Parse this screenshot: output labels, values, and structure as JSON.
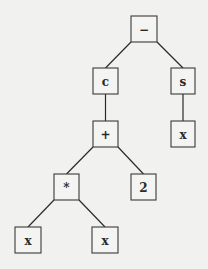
{
  "diagram": {
    "type": "expression-tree",
    "nodes": [
      {
        "id": "n_minus",
        "label": "−",
        "x": 131,
        "y": 16,
        "w": 26,
        "h": 26
      },
      {
        "id": "n_c",
        "label": "c",
        "x": 93,
        "y": 68,
        "w": 25,
        "h": 26
      },
      {
        "id": "n_s",
        "label": "s",
        "x": 171,
        "y": 68,
        "w": 24,
        "h": 26
      },
      {
        "id": "n_plus",
        "label": "+",
        "x": 93,
        "y": 121,
        "w": 25,
        "h": 26
      },
      {
        "id": "n_x_s",
        "label": "x",
        "x": 171,
        "y": 121,
        "w": 24,
        "h": 26
      },
      {
        "id": "n_mul",
        "label": "*",
        "x": 54,
        "y": 174,
        "w": 25,
        "h": 26
      },
      {
        "id": "n_two",
        "label": "2",
        "x": 131,
        "y": 174,
        "w": 25,
        "h": 26
      },
      {
        "id": "n_x_l",
        "label": "x",
        "x": 15,
        "y": 227,
        "w": 26,
        "h": 26
      },
      {
        "id": "n_x_r",
        "label": "x",
        "x": 92,
        "y": 227,
        "w": 26,
        "h": 26
      }
    ],
    "edges": [
      {
        "from": "n_minus",
        "to": "n_c"
      },
      {
        "from": "n_minus",
        "to": "n_s"
      },
      {
        "from": "n_c",
        "to": "n_plus"
      },
      {
        "from": "n_s",
        "to": "n_x_s"
      },
      {
        "from": "n_plus",
        "to": "n_mul"
      },
      {
        "from": "n_plus",
        "to": "n_two"
      },
      {
        "from": "n_mul",
        "to": "n_x_l"
      },
      {
        "from": "n_mul",
        "to": "n_x_r"
      }
    ]
  }
}
